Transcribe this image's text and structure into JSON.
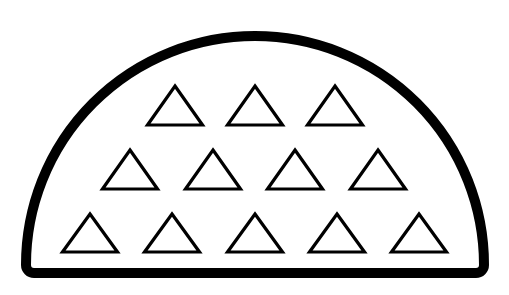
{
  "figure": {
    "type": "geometric-counting-figure",
    "title": "Half-disc containing triangles",
    "canvas": {
      "width": 509,
      "height": 295,
      "background": "#ffffff"
    },
    "container": {
      "name": "half-disc",
      "shape": "semicircle",
      "orientation": "flat-side-down",
      "center_x": 255,
      "center_y": 273,
      "radius": 229,
      "stroke_color": "#000000",
      "stroke_width": 10,
      "fill_color": "#ffffff",
      "corner_radius": 8,
      "left_x": 26,
      "right_x": 484,
      "top_y": 44,
      "baseline_y": 273
    },
    "items": {
      "shape": "triangle",
      "orientation": "point-up",
      "count": 12,
      "stroke_color": "#000000",
      "stroke_width": 3.2,
      "fill_color": "#ffffff",
      "width": 55,
      "height": 39,
      "rows": [
        {
          "row_index": 1,
          "label": "top-row",
          "count": 3,
          "apex_y": 86,
          "base_y": 125,
          "centers_x": [
            175,
            255,
            335
          ]
        },
        {
          "row_index": 2,
          "label": "middle-row",
          "count": 4,
          "apex_y": 150,
          "base_y": 189,
          "centers_x": [
            130,
            213,
            295,
            378
          ]
        },
        {
          "row_index": 3,
          "label": "bottom-row",
          "count": 5,
          "apex_y": 214,
          "base_y": 252,
          "centers_x": [
            90,
            172,
            255,
            337,
            419
          ]
        }
      ]
    },
    "colors": {
      "ink": "#000000",
      "paper": "#ffffff"
    }
  }
}
